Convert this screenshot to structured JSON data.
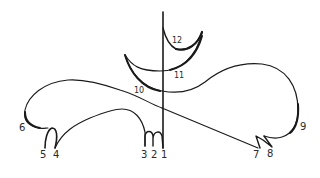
{
  "diagram": {
    "type": "hand-drawn line figure",
    "background": "#ffffff",
    "ink_color": "#1a1a1a",
    "labels": [
      {
        "id": "1",
        "text": "1",
        "x": 163,
        "y": 158
      },
      {
        "id": "2",
        "text": "2",
        "x": 154,
        "y": 158
      },
      {
        "id": "3",
        "text": "3",
        "x": 145,
        "y": 158
      },
      {
        "id": "4",
        "text": "4",
        "x": 57,
        "y": 158
      },
      {
        "id": "5",
        "text": "5",
        "x": 44,
        "y": 158
      },
      {
        "id": "6",
        "text": "6",
        "x": 23,
        "y": 131
      },
      {
        "id": "7",
        "text": "7",
        "x": 257,
        "y": 158
      },
      {
        "id": "8",
        "text": "8",
        "x": 271,
        "y": 157
      },
      {
        "id": "9",
        "text": "9",
        "x": 302,
        "y": 130
      },
      {
        "id": "10",
        "text": "10",
        "x": 139,
        "y": 93
      },
      {
        "id": "11",
        "text": "11",
        "x": 177,
        "y": 78
      },
      {
        "id": "12",
        "text": "12",
        "x": 177,
        "y": 43
      }
    ]
  }
}
